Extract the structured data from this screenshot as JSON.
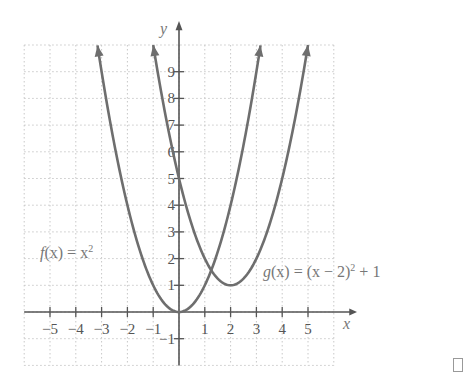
{
  "chart_data": {
    "type": "line",
    "title": "",
    "xlabel": "x",
    "ylabel": "y",
    "xlim": [
      -6,
      6
    ],
    "ylim": [
      -2,
      10
    ],
    "grid": true,
    "x_ticks": [
      -5,
      -4,
      -3,
      -2,
      -1,
      1,
      2,
      3,
      4,
      5
    ],
    "y_ticks": [
      -1,
      1,
      2,
      3,
      4,
      5,
      6,
      7,
      8,
      9
    ],
    "x_tick_labels": [
      "−5",
      "−4",
      "−3",
      "−2",
      "−1",
      "1",
      "2",
      "3",
      "4",
      "5"
    ],
    "y_tick_labels": [
      "−1",
      "1",
      "2",
      "3",
      "4",
      "5",
      "6",
      "7",
      "8",
      "9"
    ],
    "series": [
      {
        "name": "f(x) = x^2",
        "label": "f(x) = x²",
        "expression": "x^2",
        "x_range": [
          -3.16,
          3.16
        ],
        "vertex": [
          0,
          0
        ],
        "points": [
          [
            -3,
            9
          ],
          [
            -2,
            4
          ],
          [
            -1,
            1
          ],
          [
            0,
            0
          ],
          [
            1,
            1
          ],
          [
            2,
            4
          ],
          [
            3,
            9
          ]
        ],
        "arrows_at_ends": true
      },
      {
        "name": "g(x) = (x - 2)^2 + 1",
        "label": "g(x) = (x − 2)² + 1",
        "expression": "(x-2)^2 + 1",
        "x_range": [
          -1.0,
          5.0
        ],
        "vertex": [
          2,
          1
        ],
        "points": [
          [
            -1,
            10
          ],
          [
            0,
            5
          ],
          [
            1,
            2
          ],
          [
            2,
            1
          ],
          [
            3,
            2
          ],
          [
            4,
            5
          ],
          [
            5,
            10
          ]
        ],
        "arrows_at_ends": true
      }
    ],
    "annotations": [
      "f(x) = x²",
      "g(x) = (x − 2)² + 1"
    ],
    "colors": {
      "curve": "#6e6e6e",
      "axis": "#555555",
      "grid": "#c8c8c8"
    }
  },
  "labels": {
    "x_axis": "x",
    "y_axis": "y",
    "f_label_fn": "f",
    "f_label_arg": "(x) = x",
    "f_label_exp": "2",
    "g_label_fn": "g",
    "g_label_arg": "(x) = (x − 2)",
    "g_label_exp": "2",
    "g_label_tail": " + 1"
  }
}
